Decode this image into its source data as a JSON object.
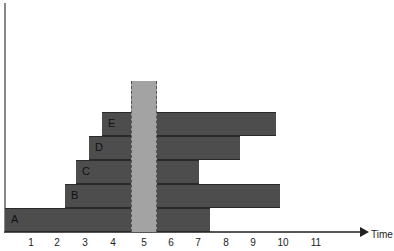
{
  "diagram": {
    "x_axis_label": "Time",
    "ticks": [
      "1",
      "2",
      "3",
      "4",
      "5",
      "6",
      "7",
      "8",
      "9",
      "10",
      "11"
    ],
    "rows": [
      {
        "label": "A",
        "left_start": 1,
        "right_end": 7
      },
      {
        "label": "B",
        "left_start": 2,
        "right_end": 10
      },
      {
        "label": "C",
        "left_start": 3,
        "right_end": 7
      },
      {
        "label": "D",
        "left_start": 3.5,
        "right_end": 8.5
      },
      {
        "label": "E",
        "left_start": 4,
        "right_end": 10
      }
    ],
    "highlight_band": {
      "at": 5,
      "color": "#a3a3a3"
    },
    "bar_color": "#4d4d4d"
  }
}
